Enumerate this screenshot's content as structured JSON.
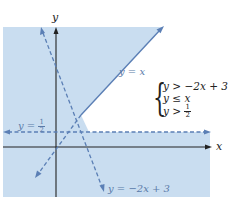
{
  "graph": {
    "axes": {
      "x_label": "x",
      "y_label": "y"
    },
    "lines": [
      {
        "id": "y-equals-x",
        "label": "y = x",
        "style": "solid-upper/dashed-lower"
      },
      {
        "id": "y-equals-neg2x-plus-3",
        "label_prefix": "y = −2x + 3",
        "style": "dashed"
      },
      {
        "id": "y-equals-half",
        "label_left": "y =",
        "label_num": "1",
        "label_den": "2",
        "style": "dashed"
      }
    ],
    "system": {
      "ineq1": "y > −2x + 3",
      "ineq2": "y ≤ x",
      "ineq3_left": "y >",
      "ineq3_num": "1",
      "ineq3_den": "2"
    },
    "colors": {
      "shade": "#c9ddf0",
      "line": "#5b7fb5",
      "axis": "#222222",
      "solution": "#ffffff"
    }
  }
}
